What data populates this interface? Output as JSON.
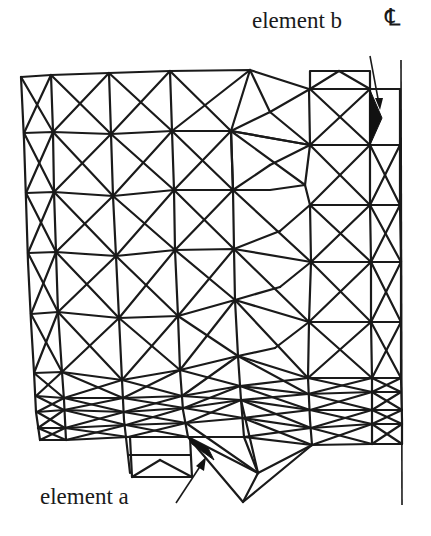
{
  "figure": {
    "type": "finite-element-mesh",
    "labels": {
      "element_b": "element b",
      "element_a": "element a",
      "centerline": "℄"
    },
    "highlighted_elements": [
      "element a",
      "element b"
    ],
    "colors": {
      "line": "#1a1a1a",
      "background": "#ffffff",
      "highlight_fill": "#111111"
    }
  }
}
